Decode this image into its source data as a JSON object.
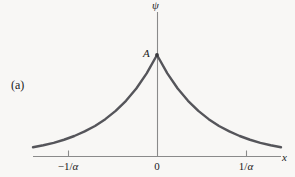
{
  "figure": {
    "panel_label": "(a)",
    "background_color": "#f8f7f5",
    "curve_color": "#55555a",
    "axis_color": "#8a8a8a",
    "text_color": "#1a1a1a"
  },
  "labels": {
    "y_axis": "ψ",
    "x_axis": "x",
    "amplitude_point": "A"
  },
  "chart_data": {
    "type": "line",
    "title": "",
    "subtitle": "",
    "xlabel": "x",
    "ylabel": "ψ",
    "grid": false,
    "legend": null,
    "annotations": [
      {
        "text": "A",
        "x": 0,
        "y": 1,
        "note": "amplitude at the cusp x = 0"
      },
      {
        "text": "(a)",
        "note": "panel identifier, left margin"
      }
    ],
    "axes": {
      "x_tick_labels": [
        "-1/α",
        "0",
        "1/α"
      ],
      "x_tick_values": [
        -1,
        0,
        1
      ],
      "x_tick_units": "1/α",
      "y_tick_labels": [
        "A"
      ],
      "y_tick_values": [
        1
      ],
      "xlim": [
        -2.4,
        2.4
      ],
      "ylim": [
        0,
        1.12
      ],
      "x_axis_at_y": 0,
      "y_axis_at_x": 0
    },
    "function": "ψ(x) = A·exp(-α|x|)",
    "series": [
      {
        "name": "ψ(x) = A e^(-α|x|)",
        "x": [
          -2.4,
          -2.2,
          -2.0,
          -1.8,
          -1.6,
          -1.4,
          -1.2,
          -1.0,
          -0.8,
          -0.6,
          -0.4,
          -0.2,
          0.0,
          0.2,
          0.4,
          0.6,
          0.8,
          1.0,
          1.2,
          1.4,
          1.6,
          1.8,
          2.0,
          2.2,
          2.4
        ],
        "values": [
          0.091,
          0.111,
          0.135,
          0.165,
          0.202,
          0.247,
          0.301,
          0.368,
          0.449,
          0.549,
          0.67,
          0.819,
          1.0,
          0.819,
          0.67,
          0.549,
          0.449,
          0.368,
          0.301,
          0.247,
          0.202,
          0.165,
          0.135,
          0.111,
          0.091
        ]
      }
    ]
  },
  "tick_labels": {
    "negative": {
      "sign": "−1/",
      "symbol": "α"
    },
    "zero": "0",
    "positive": {
      "sign": "1/",
      "symbol": "α"
    }
  }
}
